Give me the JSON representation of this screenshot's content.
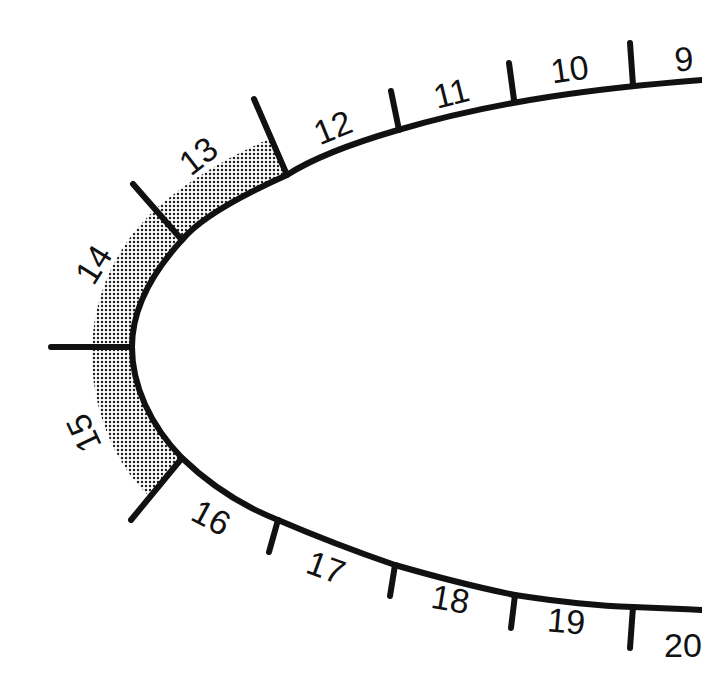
{
  "diagram": {
    "colors": {
      "outline": "#111111",
      "shade": "#9a9a9a",
      "background": "#ffffff"
    },
    "shaded_segments": [
      "13",
      "14",
      "15"
    ],
    "segments": [
      {
        "label": "9",
        "x": 684,
        "y": 62,
        "rot": -4
      },
      {
        "label": "10",
        "x": 570,
        "y": 78,
        "rot": -8
      },
      {
        "label": "11",
        "x": 452,
        "y": 104,
        "rot": -14
      },
      {
        "label": "12",
        "x": 333,
        "y": 140,
        "rot": -22
      },
      {
        "label": "13",
        "x": 202,
        "y": 168,
        "rot": -38
      },
      {
        "label": "14",
        "x": 99,
        "y": 272,
        "rot": -58
      },
      {
        "label": "15",
        "x": 93,
        "y": 432,
        "rot": -115
      },
      {
        "label": "16",
        "x": 210,
        "y": 520,
        "rot": 28
      },
      {
        "label": "17",
        "x": 325,
        "y": 568,
        "rot": 20
      },
      {
        "label": "18",
        "x": 450,
        "y": 604,
        "rot": 10
      },
      {
        "label": "19",
        "x": 567,
        "y": 627,
        "rot": 5
      },
      {
        "label": "20",
        "x": 682,
        "y": 645,
        "rot": 0
      }
    ]
  }
}
